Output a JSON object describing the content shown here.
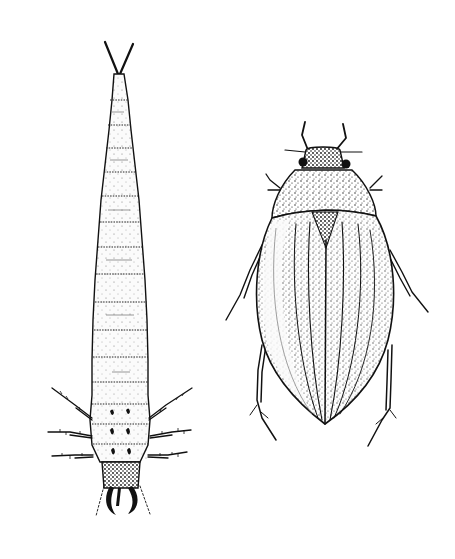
{
  "figure": {
    "background_color": "#ffffff",
    "ink_color": "#111111",
    "subjects": [
      {
        "id": "larva",
        "description": "Segmented aquatic beetle larva, elongate tapering body, two slender terminal filaments at top, six legs near lower end, sickle-shaped mandibles at bottom",
        "position": "left"
      },
      {
        "id": "adult",
        "description": "Adult water beetle, dorsal view, oval stippled elytra with longitudinal striae, short antennae, eyes, six legs",
        "position": "right"
      }
    ]
  }
}
